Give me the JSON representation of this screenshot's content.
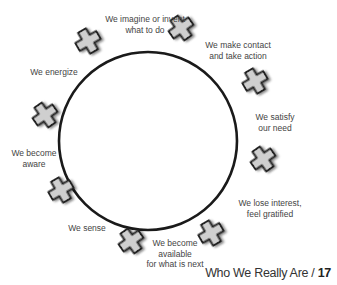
{
  "diagram": {
    "type": "cycle",
    "circle": {
      "cx": 148,
      "cy": 141,
      "r": 89,
      "stroke": "#1a1a1a"
    },
    "cross_color": "#cfcfcf",
    "cross_stroke": "#222222",
    "steps": [
      {
        "label_line1": "We imagine or invent",
        "label_line2": "what to do",
        "label_line3": "",
        "label_x": 145,
        "label_y": 14,
        "cross_x": 88,
        "cross_y": 41,
        "cross_rot": -30
      },
      {
        "label_line1": "We make contact",
        "label_line2": "and take action",
        "label_line3": "",
        "label_x": 238,
        "label_y": 40,
        "cross_x": 181,
        "cross_y": 28,
        "cross_rot": -35
      },
      {
        "label_line1": "We satisfy",
        "label_line2": "our need",
        "label_line3": "",
        "label_x": 275,
        "label_y": 112,
        "cross_x": 255,
        "cross_y": 81,
        "cross_rot": -30
      },
      {
        "label_line1": "We lose interest,",
        "label_line2": "feel gratified",
        "label_line3": "",
        "label_x": 270,
        "label_y": 198,
        "cross_x": 263,
        "cross_y": 159,
        "cross_rot": -35
      },
      {
        "label_line1": "We become",
        "label_line2": "available",
        "label_line3": "for what is next",
        "label_x": 175,
        "label_y": 238,
        "cross_x": 211,
        "cross_y": 233,
        "cross_rot": -30
      },
      {
        "label_line1": "We sense",
        "label_line2": "",
        "label_line3": "",
        "label_x": 87,
        "label_y": 223,
        "cross_x": 131,
        "cross_y": 241,
        "cross_rot": -35
      },
      {
        "label_line1": "We become",
        "label_line2": "aware",
        "label_line3": "",
        "label_x": 34,
        "label_y": 148,
        "cross_x": 61,
        "cross_y": 190,
        "cross_rot": -30
      },
      {
        "label_line1": "We energize",
        "label_line2": "",
        "label_line3": "",
        "label_x": 54,
        "label_y": 67,
        "cross_x": 45,
        "cross_y": 115,
        "cross_rot": -35
      }
    ]
  },
  "footer": {
    "title": "Who We Really Are / ",
    "page_number": "17"
  }
}
